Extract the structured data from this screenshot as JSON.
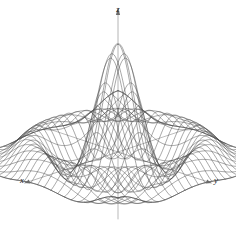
{
  "figure": {
    "title": "",
    "background_color": "#ffffff",
    "line_color": "#4a4a4a",
    "axis_color": "#6b6b6b",
    "label_color": "#1a1a1a"
  },
  "axes": {
    "z": {
      "label": "z",
      "name": "z-axis",
      "direction": "up"
    },
    "x": {
      "label": "x",
      "name": "x-axis",
      "direction": "lower-left"
    },
    "y": {
      "label": "y",
      "name": "y-axis",
      "direction": "lower-right"
    }
  },
  "chart_data": {
    "type": "line",
    "plot_kind": "3d-wireframe-surface",
    "title": "",
    "xlabel": "x",
    "ylabel": "y",
    "zlabel": "z",
    "function": "z = sin(r)/r",
    "grid": true,
    "legend": false,
    "legend_position": "none",
    "xlim": [
      -10,
      10
    ],
    "ylim": [
      -10,
      10
    ],
    "zlim": [
      -0.25,
      1.0
    ],
    "grid_lines_u": 25,
    "grid_lines_v": 25,
    "projection": {
      "type": "oblique",
      "x_axis_screen_dir": [
        -1,
        0.33
      ],
      "y_axis_screen_dir": [
        1,
        0.33
      ],
      "z_axis_screen_dir": [
        0,
        -1
      ]
    },
    "x": [
      -10,
      -9.167,
      -8.333,
      -7.5,
      -6.667,
      -5.833,
      -5,
      -4.167,
      -3.333,
      -2.5,
      -1.667,
      -0.833,
      0,
      0.833,
      1.667,
      2.5,
      3.333,
      4.167,
      5,
      5.833,
      6.667,
      7.5,
      8.333,
      9.167,
      10
    ],
    "y": [
      -10,
      -9.167,
      -8.333,
      -7.5,
      -6.667,
      -5.833,
      -5,
      -4.167,
      -3.333,
      -2.5,
      -1.667,
      -0.833,
      0,
      0.833,
      1.667,
      2.5,
      3.333,
      4.167,
      5,
      5.833,
      6.667,
      7.5,
      8.333,
      9.167,
      10
    ],
    "series": [
      {
        "name": "z(x,0) centerline",
        "values": [
          -0.054,
          0.024,
          0.106,
          0.125,
          0.055,
          -0.065,
          -0.192,
          -0.207,
          -0.058,
          0.239,
          0.597,
          0.887,
          1.0,
          0.887,
          0.597,
          0.239,
          -0.058,
          -0.207,
          -0.192,
          -0.065,
          0.055,
          0.125,
          0.106,
          0.024,
          -0.054
        ]
      },
      {
        "name": "z(x,x) diagonal",
        "values": [
          0.987,
          0.553,
          -0.042,
          -0.071,
          0.051,
          0.033,
          -0.04,
          -0.079,
          0.073,
          0.141,
          -0.151,
          -0.157,
          1.0,
          -0.157,
          -0.151,
          0.141,
          0.073,
          -0.079,
          -0.04,
          0.033,
          0.051,
          -0.071,
          -0.042,
          0.553,
          0.987
        ]
      }
    ],
    "annotations": [
      {
        "text": "z",
        "position": "top-center",
        "role": "axis-label"
      },
      {
        "text": "x",
        "position": "bottom-left",
        "role": "axis-label"
      },
      {
        "text": "y",
        "position": "bottom-right",
        "role": "axis-label"
      }
    ]
  }
}
